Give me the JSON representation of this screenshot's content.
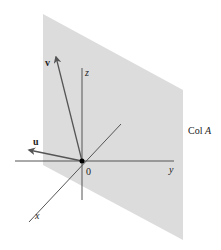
{
  "figure": {
    "plane_label": "Col A",
    "plane_label_main": "Col ",
    "plane_label_var": "A",
    "origin_label": "0",
    "axes": {
      "x_label": "x",
      "y_label": "y",
      "z_label": "z"
    },
    "vectors": {
      "u_label": "u",
      "v_label": "v"
    },
    "colors": {
      "plane": "#dcdcdc",
      "lines": "#555555",
      "vectors": "#555555",
      "origin_dot": "#000000",
      "text": "#222222"
    }
  }
}
